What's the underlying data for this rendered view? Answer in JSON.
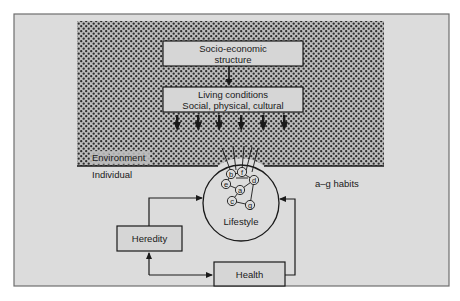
{
  "diagram": {
    "colors": {
      "page_bg": "#ffffff",
      "frame_bg": "#dcdcdc",
      "frame_border": "#6e6e6e",
      "stipple_bg": "#bdbdbd",
      "stipple_dot": "#2b2b2b",
      "box_fill": "#d6d6d6",
      "line": "#1a1a1a"
    },
    "boxes": {
      "socio_economic": {
        "line1": "Socio-economic",
        "line2": "structure"
      },
      "living_conditions": {
        "line1": "Living conditions",
        "line2": "Social, physical, cultural"
      },
      "heredity": {
        "label": "Heredity"
      },
      "health": {
        "label": "Health"
      }
    },
    "regions": {
      "environment": "Environment",
      "individual": "Individual"
    },
    "lifestyle": {
      "label": "Lifestyle",
      "habits": [
        "a",
        "b",
        "c",
        "d",
        "e",
        "f",
        "g"
      ]
    },
    "legend": {
      "habits_note": "a–g habits"
    },
    "arrows_from_living_conditions": 6
  }
}
